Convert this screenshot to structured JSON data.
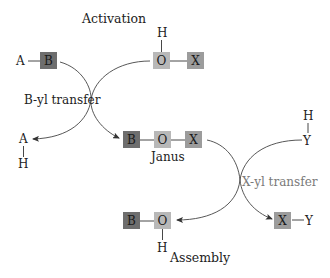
{
  "diagram": {
    "colors": {
      "B_box": "#6e6e6e",
      "O_box": "#b8b8b8",
      "X_box": "#9c9c9c",
      "xyl_label": "#7a7a7a",
      "text": "#222222"
    },
    "titles": {
      "activation": "Activation",
      "assembly": "Assembly"
    },
    "activation": {
      "reactant_left": {
        "atom": "A",
        "box": "B"
      },
      "reactant_right": {
        "top": "H",
        "box1": "O",
        "box2": "X"
      }
    },
    "byl_transfer": {
      "label": "B-yl transfer",
      "byproduct": {
        "top": "A",
        "bottom": "H"
      }
    },
    "janus": {
      "boxes": [
        "B",
        "O",
        "X"
      ],
      "label": "Janus"
    },
    "xyl_transfer": {
      "label": "X-yl transfer",
      "reagent": {
        "top": "H",
        "bottom": "Y"
      }
    },
    "assembly": {
      "product_left": {
        "box1": "B",
        "box2": "O",
        "bottom": "H"
      },
      "product_right": {
        "box": "X",
        "atom": "Y"
      }
    }
  }
}
